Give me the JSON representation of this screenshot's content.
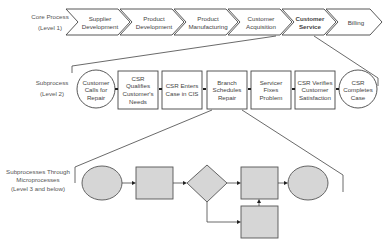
{
  "levels": {
    "level1": {
      "title": "Core Process",
      "subtitle": "(Level 1)"
    },
    "level2": {
      "title": "Subprocess",
      "subtitle": "(Level 2)"
    },
    "level3": {
      "title": "Subprocesses Through",
      "title2": "Microprocesses",
      "subtitle": "(Level 3 and below)"
    }
  },
  "core_process": [
    {
      "l1": "Supplier",
      "l2": "Development"
    },
    {
      "l1": "Product",
      "l2": "Development"
    },
    {
      "l1": "Product",
      "l2": "Manufacturing"
    },
    {
      "l1": "Customer",
      "l2": "Acquisition"
    },
    {
      "l1": "Customer",
      "l2": "Service",
      "highlight": true
    },
    {
      "l1": "Billing",
      "l2": ""
    }
  ],
  "subprocess": [
    {
      "shape": "circle",
      "l1": "Customer",
      "l2": "Calls for",
      "l3": "Repair"
    },
    {
      "shape": "box",
      "l1": "CSR",
      "l2": "Qualifies",
      "l3": "Customer's",
      "l4": "Needs"
    },
    {
      "shape": "box",
      "l1": "CSR Enters",
      "l2": "Case in CIS"
    },
    {
      "shape": "box",
      "l1": "Branch",
      "l2": "Schedules",
      "l3": "Repair"
    },
    {
      "shape": "box",
      "l1": "Servicer",
      "l2": "Fixes",
      "l3": "Problem"
    },
    {
      "shape": "box",
      "l1": "CSR Verifies",
      "l2": "Customer",
      "l3": "Satisfaction"
    },
    {
      "shape": "circle",
      "l1": "CSR",
      "l2": "Completes",
      "l3": "Case"
    }
  ],
  "colors": {
    "shape_fill": "#d6d6d6",
    "stroke": "#555555",
    "line": "#444444"
  }
}
